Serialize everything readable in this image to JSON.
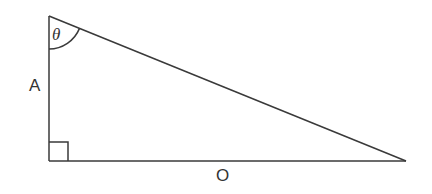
{
  "diagram": {
    "type": "right-triangle",
    "stroke_color": "#3a3a3a",
    "vertices": {
      "top": [
        49,
        16
      ],
      "right_angle": [
        49,
        161
      ],
      "far": [
        406,
        161
      ]
    },
    "labels": {
      "angle": "θ",
      "vertical_side": "A",
      "horizontal_side": "O"
    },
    "right_angle_marker": true,
    "angle_arc_at": "top"
  }
}
